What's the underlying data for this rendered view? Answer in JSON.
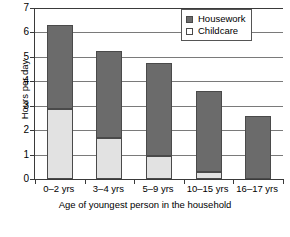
{
  "chart_data": {
    "type": "bar",
    "subtype": "stacked-vertical",
    "title": "",
    "xlabel": "Age of youngest person in the household",
    "ylabel": "Hours per day",
    "ylim": [
      0,
      7
    ],
    "ytick_labels": [
      "7",
      "6",
      "5",
      "4",
      "3",
      "2",
      "1",
      "0"
    ],
    "ytick_values": [
      7,
      6,
      5,
      4,
      3,
      2,
      1,
      0
    ],
    "grid": true,
    "legend_position": "top-right",
    "categories": [
      "0–2 yrs",
      "3–4 yrs",
      "5–9 yrs",
      "10–15 yrs",
      "16–17 yrs"
    ],
    "series": [
      {
        "name": "Childcare",
        "color": "#e2e2e2",
        "values": [
          2.85,
          1.68,
          0.95,
          0.3,
          0.0
        ]
      },
      {
        "name": "Housework",
        "color": "#6b6b6b",
        "values": [
          3.45,
          3.57,
          3.8,
          3.32,
          2.6
        ]
      }
    ],
    "totals": [
      6.3,
      5.25,
      4.75,
      3.62,
      2.6
    ]
  },
  "axes": {
    "y_title": "Hours per day",
    "x_title": "Age of youngest person in the household"
  },
  "legend": {
    "items": [
      {
        "label": "Housework",
        "swatch": "filled-dark-square"
      },
      {
        "label": "Childcare",
        "swatch": "empty-light-square"
      }
    ]
  }
}
